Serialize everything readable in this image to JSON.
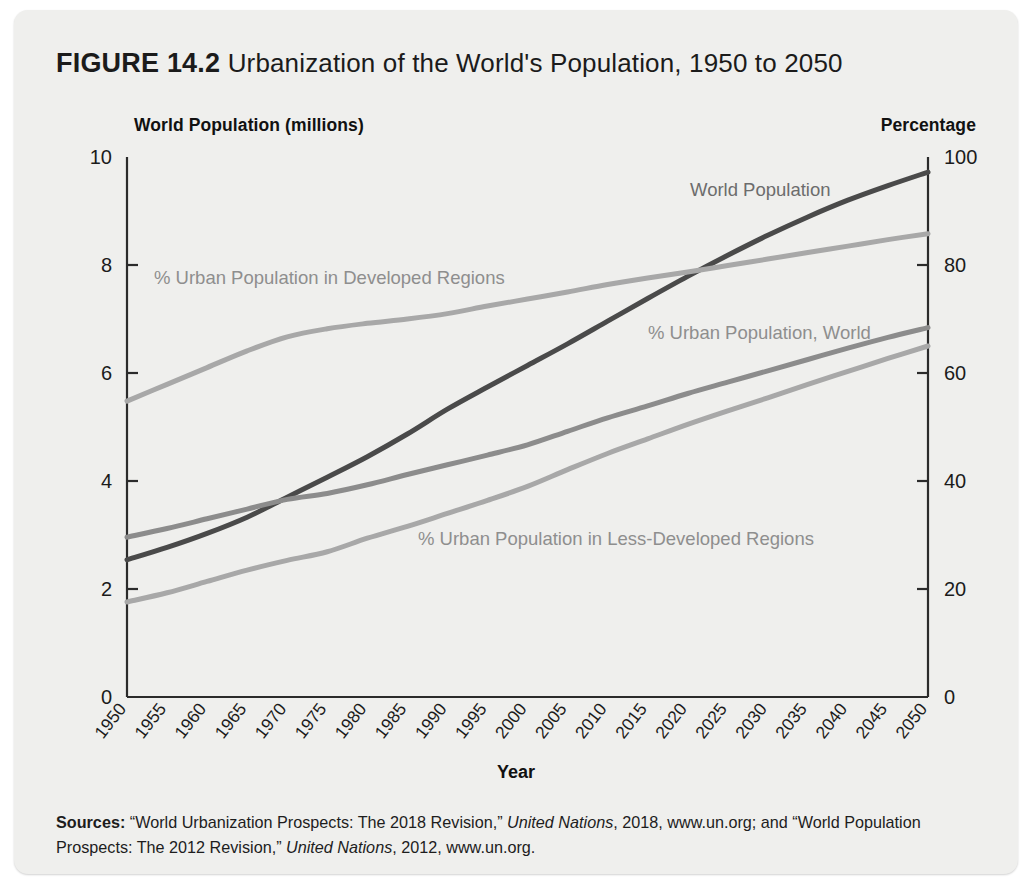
{
  "figure": {
    "label": "FIGURE 14.2",
    "caption": "Urbanization of the World's Population, 1950 to 2050"
  },
  "axes": {
    "left_caption": "World Population (millions)",
    "right_caption": "Percentage",
    "xaxis_title": "Year"
  },
  "sources": {
    "prefix": "Sources:",
    "line1_a": " “World Urbanization Prospects: The 2018 Revision,” ",
    "line1_italic": "United Nations",
    "line1_b": ", 2018, www.un.org; and “World Population Prospects: The 2012 Revision,” ",
    "line2_italic": "United Nations",
    "line2_b": ", 2012, www.un.org."
  },
  "colors": {
    "card_background": "#efefed",
    "axis": "#2b2b2b",
    "world_population": "#4a4a4a",
    "urban_world": "#8c8c8c",
    "urban_developed": "#a8a8a8",
    "urban_less_developed": "#a8a8a8",
    "label_text": "#8e8e8e",
    "tick_text": "#1b1b1b"
  },
  "chart_data": {
    "type": "line",
    "title": "Urbanization of the World's Population, 1950 to 2050",
    "xlabel": "Year",
    "ylabel": "World Population (millions)",
    "y2label": "Percentage",
    "xlim": [
      1950,
      2050
    ],
    "ylim": [
      0,
      10
    ],
    "y2lim": [
      0,
      100
    ],
    "grid": false,
    "legend": "inline-annotations",
    "x": [
      1950,
      1955,
      1960,
      1965,
      1970,
      1975,
      1980,
      1985,
      1990,
      1995,
      2000,
      2005,
      2010,
      2015,
      2020,
      2025,
      2030,
      2035,
      2040,
      2045,
      2050
    ],
    "xtick_labels": [
      "1950",
      "1955",
      "1960",
      "1965",
      "1970",
      "1975",
      "1980",
      "1985",
      "1990",
      "1995",
      "2000",
      "2005",
      "2010",
      "2015",
      "2020",
      "2025",
      "2030",
      "2035",
      "2040",
      "2045",
      "2050"
    ],
    "ytick_labels": [
      "0",
      "2",
      "4",
      "6",
      "8",
      "10"
    ],
    "ytick_values": [
      0,
      2,
      4,
      6,
      8,
      10
    ],
    "y2tick_labels": [
      "0",
      "20",
      "40",
      "60",
      "80",
      "100"
    ],
    "y2tick_values": [
      0,
      20,
      40,
      60,
      80,
      100
    ],
    "series": [
      {
        "name": "World Population",
        "label": "World Population",
        "axis": "left",
        "unit": "billions",
        "color": "#4a4a4a",
        "width": 5,
        "values": [
          2.54,
          2.77,
          3.03,
          3.33,
          3.7,
          4.07,
          4.45,
          4.87,
          5.33,
          5.74,
          6.14,
          6.54,
          6.96,
          7.38,
          7.79,
          8.18,
          8.55,
          8.89,
          9.2,
          9.47,
          9.72
        ]
      },
      {
        "name": "% Urban Population in Developed Regions",
        "label": "% Urban Population in Developed Regions",
        "axis": "right",
        "unit": "percent",
        "color": "#a8a8a8",
        "width": 5,
        "values": [
          54.8,
          57.9,
          61.0,
          64.1,
          66.7,
          68.2,
          69.2,
          70.0,
          71.0,
          72.4,
          73.7,
          75.0,
          76.4,
          77.6,
          78.7,
          79.9,
          81.1,
          82.3,
          83.5,
          84.7,
          85.8
        ]
      },
      {
        "name": "% Urban Population, World",
        "label": "% Urban Population, World",
        "axis": "right",
        "unit": "percent",
        "color": "#8c8c8c",
        "width": 5,
        "values": [
          29.6,
          31.2,
          33.0,
          34.8,
          36.6,
          37.7,
          39.3,
          41.2,
          43.0,
          44.8,
          46.7,
          49.2,
          51.7,
          53.9,
          56.2,
          58.3,
          60.4,
          62.5,
          64.6,
          66.6,
          68.4
        ]
      },
      {
        "name": "% Urban Population in Less-Developed Regions",
        "label": "% Urban Population in Less-Developed Regions",
        "axis": "right",
        "unit": "percent",
        "color": "#a8a8a8",
        "width": 5,
        "values": [
          17.6,
          19.3,
          21.4,
          23.5,
          25.3,
          26.9,
          29.4,
          31.6,
          34.0,
          36.4,
          39.0,
          42.1,
          45.1,
          47.8,
          50.5,
          53.0,
          55.4,
          57.9,
          60.3,
          62.7,
          65.0
        ]
      }
    ],
    "annotations": [
      {
        "text": "World Population",
        "x_px": 676,
        "y_px": 186,
        "anchor": "start",
        "tone": "dark"
      },
      {
        "text": "% Urban Population in Developed Regions",
        "x_px": 140,
        "y_px": 274,
        "anchor": "start",
        "tone": "light"
      },
      {
        "text": "% Urban Population, World",
        "x_px": 634,
        "y_px": 329,
        "anchor": "start",
        "tone": "light"
      },
      {
        "text": "% Urban Population in Less-Developed Regions",
        "x_px": 404,
        "y_px": 535,
        "anchor": "start",
        "tone": "light"
      }
    ]
  }
}
